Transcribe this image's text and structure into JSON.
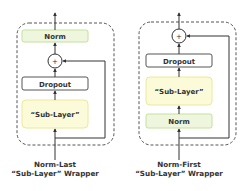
{
  "colors": {
    "norm_fill": "#eef7de",
    "norm_stroke": "#c6df9e",
    "sublayer_fill": "#fcfbd9",
    "sublayer_stroke": "#ece89a",
    "dropout_fill": "#ffffff",
    "dropout_stroke": "#555555",
    "line": "#333333",
    "dash": "#555555"
  },
  "left": {
    "norm_label": "Norm",
    "add_symbol": "+",
    "dropout_label": "Dropout",
    "sublayer_label": "“Sub-Layer”",
    "caption_line1": "Norm-Last",
    "caption_line2": "“Sub-Layer” Wrapper"
  },
  "right": {
    "add_symbol": "+",
    "dropout_label": "Dropout",
    "sublayer_label": "“Sub-Layer”",
    "norm_label": "Norm",
    "caption_line1": "Norm-First",
    "caption_line2": "“Sub-Layer” Wrapper"
  }
}
